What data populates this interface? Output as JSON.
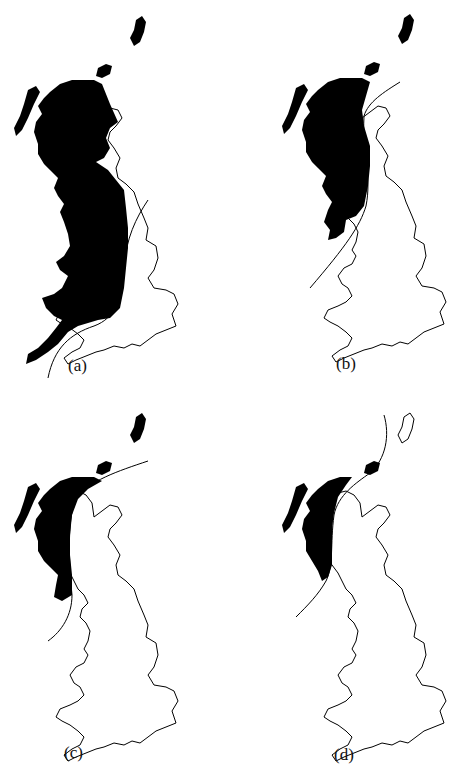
{
  "figure": {
    "panels": [
      {
        "id": "a",
        "label": "(a)"
      },
      {
        "id": "b",
        "label": "(b)"
      },
      {
        "id": "c",
        "label": "(c)"
      },
      {
        "id": "d",
        "label": "(d)"
      }
    ]
  },
  "colors": {
    "fill": "#000000",
    "outline": "#000000",
    "background": "#ffffff"
  }
}
